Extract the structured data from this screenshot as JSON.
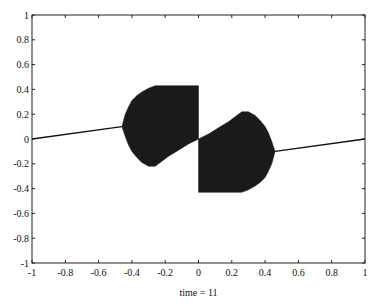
{
  "chart_data": {
    "type": "line",
    "title": "",
    "xlabel": "time = 11",
    "ylabel": "",
    "xlim": [
      -1,
      1
    ],
    "ylim": [
      -1,
      1
    ],
    "grid": false,
    "legend": "none",
    "xticks": [
      -1,
      -0.8,
      -0.6,
      -0.4,
      -0.2,
      0,
      0.2,
      0.4,
      0.6,
      0.8,
      1
    ],
    "xtick_labels": [
      "-1",
      "-0.8",
      "-0.6",
      "-0.4",
      "-0.2",
      "0",
      "0.2",
      "0.4",
      "0.6",
      "0.8",
      "1"
    ],
    "yticks": [
      -1,
      -0.8,
      -0.6,
      -0.4,
      -0.2,
      0,
      0.2,
      0.4,
      0.6,
      0.8,
      1
    ],
    "ytick_labels": [
      "-1",
      "-0.8",
      "-0.6",
      "-0.4",
      "-0.2",
      "0",
      "0.2",
      "0.4",
      "0.6",
      "0.8",
      "1"
    ],
    "series": [
      {
        "name": "left-line",
        "kind": "line",
        "x": [
          -1,
          -0.46
        ],
        "y": [
          0,
          0.1
        ]
      },
      {
        "name": "right-line",
        "kind": "line",
        "x": [
          0.46,
          1
        ],
        "y": [
          -0.1,
          0
        ]
      },
      {
        "name": "left-oscillation-envelope",
        "kind": "filled-band",
        "x": [
          -0.46,
          -0.44,
          -0.42,
          -0.4,
          -0.37,
          -0.34,
          -0.3,
          -0.26,
          -0.22,
          -0.18,
          -0.12,
          -0.06,
          0.0
        ],
        "upper": [
          0.1,
          0.2,
          0.26,
          0.31,
          0.35,
          0.38,
          0.41,
          0.43,
          0.43,
          0.43,
          0.43,
          0.43,
          0.43
        ],
        "lower": [
          0.1,
          0.02,
          -0.05,
          -0.1,
          -0.15,
          -0.19,
          -0.22,
          -0.22,
          -0.18,
          -0.14,
          -0.09,
          -0.04,
          0.0
        ]
      },
      {
        "name": "right-oscillation-envelope",
        "kind": "filled-band",
        "x": [
          0.0,
          0.06,
          0.12,
          0.18,
          0.22,
          0.26,
          0.3,
          0.34,
          0.37,
          0.4,
          0.42,
          0.44,
          0.46
        ],
        "upper": [
          0.0,
          0.04,
          0.09,
          0.14,
          0.18,
          0.22,
          0.22,
          0.19,
          0.15,
          0.1,
          0.05,
          -0.02,
          -0.1
        ],
        "lower": [
          -0.43,
          -0.43,
          -0.43,
          -0.43,
          -0.43,
          -0.43,
          -0.41,
          -0.38,
          -0.35,
          -0.31,
          -0.26,
          -0.2,
          -0.1
        ]
      }
    ]
  }
}
